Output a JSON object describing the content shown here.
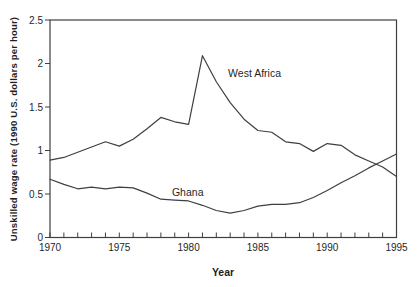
{
  "figure": {
    "background": "#ffffff",
    "axis_color": "#3f3f3f",
    "text_color": "#1f1f1f"
  },
  "chart_data": {
    "type": "line",
    "title": "",
    "xlabel": "Year",
    "ylabel": "Unskilled wage rate (1990 U.S. dollars per hour)",
    "xlim": [
      1970,
      1995
    ],
    "ylim": [
      0,
      2.5
    ],
    "grid": false,
    "legend_position": "inline-annotations",
    "xticks_major": [
      1970,
      1975,
      1980,
      1985,
      1990,
      1995
    ],
    "xtick_minor_step": 1,
    "yticks": [
      0,
      0.5,
      1,
      1.5,
      2,
      2.5
    ],
    "ytick_labels": [
      "0",
      "0.5",
      "1",
      "1.5",
      "2",
      "2.5"
    ],
    "x": [
      1970,
      1971,
      1972,
      1973,
      1974,
      1975,
      1976,
      1977,
      1978,
      1979,
      1980,
      1981,
      1982,
      1983,
      1984,
      1985,
      1986,
      1987,
      1988,
      1989,
      1990,
      1991,
      1992,
      1993,
      1994,
      1995
    ],
    "series": [
      {
        "name": "West Africa",
        "color": "#3f3f3f",
        "values": [
          0.89,
          0.92,
          0.98,
          1.04,
          1.1,
          1.05,
          1.13,
          1.25,
          1.38,
          1.33,
          1.3,
          2.09,
          1.79,
          1.55,
          1.36,
          1.23,
          1.21,
          1.1,
          1.08,
          0.99,
          1.08,
          1.06,
          0.95,
          0.88,
          0.81,
          0.7
        ]
      },
      {
        "name": "Ghana",
        "color": "#3f3f3f",
        "values": [
          0.67,
          0.61,
          0.56,
          0.58,
          0.56,
          0.58,
          0.57,
          0.51,
          0.44,
          0.43,
          0.42,
          0.37,
          0.31,
          0.28,
          0.31,
          0.36,
          0.38,
          0.38,
          0.4,
          0.46,
          0.54,
          0.63,
          0.71,
          0.8,
          0.88,
          0.96
        ]
      }
    ],
    "annotations": [
      {
        "text": "West Africa",
        "x": 1982.85,
        "y": 1.89,
        "anchor": "start"
      },
      {
        "text": "Ghana",
        "x": 1978.8,
        "y": 0.52,
        "anchor": "start"
      }
    ]
  }
}
